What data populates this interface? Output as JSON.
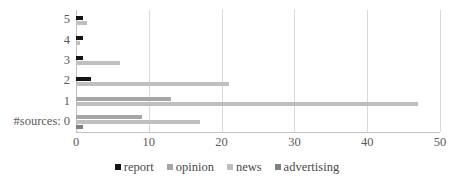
{
  "chart_data": {
    "type": "bar",
    "orientation": "horizontal",
    "title": "",
    "xlabel": "",
    "ylabel": "#sources:",
    "categories": [
      "5",
      "4",
      "3",
      "2",
      "1",
      "0"
    ],
    "category_axis_prefix": "#sources:",
    "xlim": [
      0,
      50
    ],
    "xticks": [
      0,
      10,
      20,
      30,
      40,
      50
    ],
    "xtick_labels": [
      "0",
      "10",
      "20",
      "30",
      "40",
      "50"
    ],
    "grid": true,
    "grid_axis": "x",
    "legend_position": "bottom",
    "series": [
      {
        "name": "report",
        "color": "#141414",
        "values": [
          1,
          1,
          1,
          2,
          0,
          0
        ]
      },
      {
        "name": "opinion",
        "color": "#a6a6a6",
        "values": [
          0,
          0,
          0,
          0,
          13,
          9
        ]
      },
      {
        "name": "news",
        "color": "#bfbfbf",
        "values": [
          1.5,
          0.5,
          6,
          21,
          47,
          17
        ]
      },
      {
        "name": "advertising",
        "color": "#808080",
        "values": [
          0,
          0,
          0,
          0,
          0,
          1
        ]
      }
    ]
  },
  "legend": {
    "items": [
      {
        "label": "report",
        "key": "report"
      },
      {
        "label": "opinion",
        "key": "opinion"
      },
      {
        "label": "news",
        "key": "news"
      },
      {
        "label": "advertising",
        "key": "advertising"
      }
    ]
  },
  "colors": {
    "report": "#141414",
    "opinion": "#a6a6a6",
    "news": "#bfbfbf",
    "advertising": "#808080",
    "gridline": "#d9d9d9",
    "axis": "#bfbfbf",
    "text": "#5a5a5a",
    "background": "#ffffff"
  }
}
